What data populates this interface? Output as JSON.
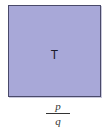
{
  "diagram": {
    "shape": "square",
    "fill_color": "#a8a8d8",
    "border_color": "#4a4a6a",
    "inner_label": "T",
    "caption": {
      "numerator": "p",
      "denominator": "q"
    }
  }
}
